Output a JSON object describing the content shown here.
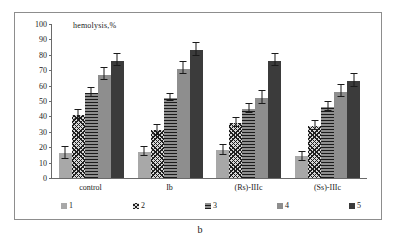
{
  "figure": {
    "caption": "b"
  },
  "chart_data": {
    "type": "bar",
    "title": "",
    "axis_title": "hemolysis,%",
    "xlabel": "",
    "ylabel": "hemolysis,%",
    "ylim": [
      0,
      100
    ],
    "ytick_step": 10,
    "yticks": [
      100,
      90,
      80,
      70,
      60,
      50,
      40,
      30,
      20,
      10,
      0
    ],
    "grid": false,
    "legend_position": "bottom",
    "categories": [
      "control",
      "Ib",
      "(Rs)-IIIc",
      "(Ss)-IIIc"
    ],
    "series": [
      {
        "name": "1",
        "fill": "solid-light-gray",
        "color": "#a8a8a8",
        "values": [
          16,
          17,
          18,
          14
        ],
        "errors": [
          4,
          3,
          3,
          3
        ]
      },
      {
        "name": "2",
        "fill": "diagonal-crosshatch",
        "color": "#d8d8d8",
        "values": [
          41,
          31,
          36,
          34
        ],
        "errors": [
          3,
          3,
          3,
          3
        ]
      },
      {
        "name": "3",
        "fill": "horizontal-lines",
        "color": "#8e8e8e",
        "values": [
          55,
          52,
          45,
          46
        ],
        "errors": [
          3,
          2,
          3,
          3
        ]
      },
      {
        "name": "4",
        "fill": "solid-medium-gray",
        "color": "#8e8e8e",
        "values": [
          67,
          71,
          52,
          56
        ],
        "errors": [
          4,
          4,
          4,
          4
        ]
      },
      {
        "name": "5",
        "fill": "solid-dark-gray",
        "color": "#3b3b3b",
        "values": [
          76,
          83,
          76,
          63
        ],
        "errors": [
          4,
          4,
          4,
          4
        ]
      }
    ]
  }
}
